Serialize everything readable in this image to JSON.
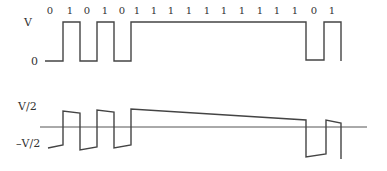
{
  "diagram": {
    "top": {
      "label_high": "V",
      "label_low": "0",
      "bits": [
        "0",
        "1",
        "0",
        "1",
        "0",
        "1",
        "1",
        "1",
        "1",
        "1",
        "1",
        "1",
        "1",
        "1",
        "1",
        "0",
        "1"
      ],
      "bit_x": [
        50,
        70,
        87,
        105,
        122,
        137,
        154,
        171,
        189,
        207,
        224,
        242,
        260,
        277,
        295,
        314,
        332
      ],
      "waveform_points": "45,61 63,61 63,22 80,22 80,61 97,61 97,22 114,22 114,61 131,61 131,22 306,22 306,60 324,60 324,22 341,22 341,61"
    },
    "bottom": {
      "label_high": "V/2",
      "label_low": "–V/2",
      "center_line": {
        "x1": 40,
        "y1": 127,
        "x2": 367,
        "y2": 127
      },
      "waveform_points": "48,148 63,145 63,111 80,113 80,150 97,147 97,110 114,112 114,148 131,145 131,109 306,120 306,157 326,154 326,120 341,123 341,159"
    }
  }
}
